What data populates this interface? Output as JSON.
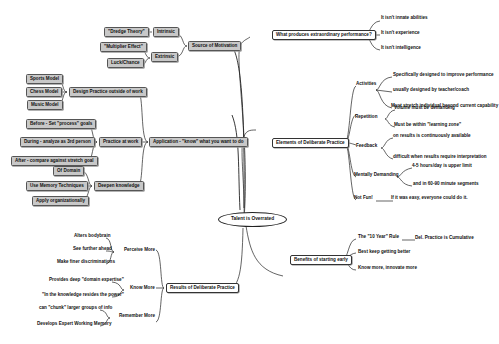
{
  "mindmap": {
    "center": "Talent is Overrated",
    "left": {
      "motivation": {
        "label": "Source of Motivation",
        "intrinsic": {
          "label": "Intrinsic",
          "children": [
            "\"Dredge Theory\""
          ]
        },
        "extrinsic": {
          "label": "Extrinsic",
          "children": [
            "\"Multiplier Effect\"",
            "Luck/Chance"
          ]
        }
      },
      "application": {
        "label": "Application - \"know\" what you want to do",
        "design": {
          "label": "Design Practice outside of work",
          "children": [
            "Sports Model",
            "Chess Model",
            "Music Model"
          ]
        },
        "practice": {
          "label": "Practice at work",
          "children": [
            "Before - Set \"process\" goals",
            "During - analyze as 3rd person",
            "After - compare against stretch goal"
          ]
        },
        "knowledge": {
          "label": "Deepen knowledge",
          "children": [
            "Of Domain",
            "Use Memory Techniques",
            "Apply organizationally"
          ]
        }
      },
      "results": {
        "label": "Results of Deliberate Practice",
        "perceive": {
          "label": "Perceive More",
          "children": [
            "Alters bodybrain",
            "See further ahead",
            "Make finer discriminations"
          ]
        },
        "know": {
          "label": "Know More",
          "children": [
            "Provides deep \"domain expertise\"",
            "\"In the knowledge resides the power\""
          ]
        },
        "remember": {
          "label": "Remember More",
          "children": [
            "can \"chunk\" larger groups of info",
            "Develops Expert Working Memory"
          ]
        }
      }
    },
    "right": {
      "what": {
        "label": "What produces extraordinary performance?",
        "children": [
          "It isn't innate abilities",
          "It isn't experience",
          "It isn't intelligence"
        ]
      },
      "elements": {
        "label": "Elements of Deliberate Practice",
        "activities": {
          "label": "Activities",
          "children": [
            "Specifically designed to improve performance",
            "usually designed by teacher/coach",
            "Must stretch individual beyond current capability"
          ]
        },
        "repetition": {
          "label": "Repetition",
          "children": [
            "Volume must be demanding",
            "Must be within \"learning zone\""
          ]
        },
        "feedback": {
          "label": "Feedback",
          "children": [
            "on results is continuously available",
            "difficult when results require interpretation"
          ]
        },
        "mental": {
          "label": "Mentally Demanding",
          "children": [
            "4-5 hours/day is upper limit",
            "and in 60-90 minute segments"
          ]
        },
        "notfun": {
          "label": "Not Fun!",
          "children": [
            "If it was easy, everyone could do it."
          ]
        }
      },
      "benefits": {
        "label": "Benefits of starting early",
        "tenyear": {
          "label": "The \"10 Year\" Rule",
          "children": [
            "Del. Practice is Cumulative"
          ]
        },
        "children": [
          "Best keep getting better",
          "Know more, innovate more"
        ]
      }
    },
    "colors": {
      "box_fill": "#c8c8c8",
      "line": "#222222",
      "background": "#ffffff"
    }
  }
}
